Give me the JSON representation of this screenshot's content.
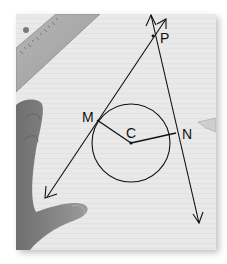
{
  "image": {
    "description": "Photo of a geometry construction on lined paper: a circle with center C, tangent lines from external point P touching the circle at M and N, radii CM and CN drawn, a ruler at top-left and a hand holding the paper.",
    "labels": {
      "point_p": "P",
      "point_m": "M",
      "point_c": "C",
      "point_n": "N"
    },
    "colors": {
      "paper": "#e9e9e9",
      "ink": "#111111",
      "ruler": "#a8a8a8",
      "hand": "#8c8c8c"
    }
  }
}
